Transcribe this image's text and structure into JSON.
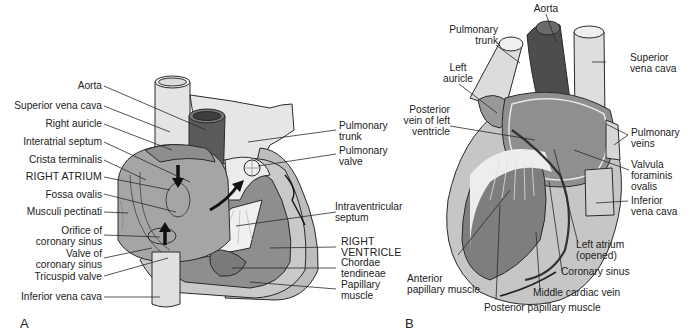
{
  "figure": {
    "panels": [
      {
        "id": "A",
        "letter": "A",
        "labels": {
          "aorta": "Aorta",
          "superior_vena_cava": "Superior vena cava",
          "right_auricle": "Right auricle",
          "interatrial_septum": "Interatrial septum",
          "crista_terminalis": "Crista terminalis",
          "right_atrium": "RIGHT ATRIUM",
          "fossa_ovalis": "Fossa ovalis",
          "musculi_pectinati": "Musculi pectinati",
          "orifice_coronary_sinus": [
            "Orifice of",
            "coronary sinus"
          ],
          "valve_coronary_sinus": [
            "Valve of",
            "coronary sinus"
          ],
          "tricuspid_valve": "Tricuspid valve",
          "inferior_vena_cava": "Inferior vena cava",
          "pulmonary_trunk": [
            "Pulmonary",
            "trunk"
          ],
          "pulmonary_valve": [
            "Pulmonary",
            "valve"
          ],
          "intraventricular_septum": [
            "Intraventricular",
            "septum"
          ],
          "right_ventricle": [
            "RIGHT",
            "VENTRICLE"
          ],
          "chordae_tendineae": [
            "Chordae",
            "tendineae"
          ],
          "papillary_muscle": [
            "Papillary",
            "muscle"
          ]
        }
      },
      {
        "id": "B",
        "letter": "B",
        "labels": {
          "aorta": "Aorta",
          "pulmonary_trunk": [
            "Pulmonary",
            "trunk"
          ],
          "left_auricle": [
            "Left",
            "auricle"
          ],
          "superior_vena_cava": [
            "Superior",
            "vena cava"
          ],
          "posterior_vein_left_ventricle": [
            "Posterior",
            "vein of left",
            "ventricle"
          ],
          "pulmonary_veins": [
            "Pulmonary",
            "veins"
          ],
          "valvula_foraminis_ovalis": [
            "Valvula",
            "foraminis",
            "ovalis"
          ],
          "inferior_vena_cava": [
            "Inferior",
            "vena cava"
          ],
          "left_atrium": [
            "Left atrium",
            "(opened)"
          ],
          "coronary_sinus": "Coronary sinus",
          "middle_cardiac_vein": "Middle cardiac vein",
          "anterior_papillary_muscle": [
            "Anterior",
            "papillary muscle"
          ],
          "posterior_papillary_muscle": "Posterior papillary muscle"
        }
      }
    ],
    "colors": {
      "background": "#ffffff",
      "vessel_light": "#e6e6e6",
      "tissue_mid": "#a9a9a9",
      "tissue_dark": "#7d7d7d",
      "aorta_dark": "#555555",
      "outline": "#2a2a2a",
      "text": "#222222"
    }
  }
}
